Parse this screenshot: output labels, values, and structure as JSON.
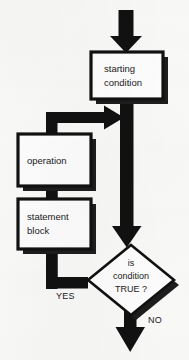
{
  "diagram": {
    "type": "flowchart",
    "background_color": "#fbfbfa",
    "ink_color": "#111111",
    "nodes": [
      {
        "id": "starting-condition",
        "shape": "rectangle",
        "lines": [
          "starting",
          "condition"
        ],
        "box": {
          "x": 91,
          "y": 52,
          "width": 72,
          "height": 47
        },
        "shadow_offset": 5
      },
      {
        "id": "operation",
        "shape": "rectangle",
        "lines": [
          "operation"
        ],
        "box": {
          "x": 18,
          "y": 134,
          "width": 73,
          "height": 52
        },
        "shadow_offset": 5
      },
      {
        "id": "statement-block",
        "shape": "rectangle",
        "lines": [
          "statement",
          "block"
        ],
        "box": {
          "x": 18,
          "y": 199,
          "width": 73,
          "height": 50
        },
        "shadow_offset": 5
      },
      {
        "id": "is-condition-true",
        "shape": "diamond",
        "lines": [
          "is",
          "condition",
          "TRUE ?"
        ],
        "center": {
          "x": 131,
          "y": 280
        },
        "half_width": 43,
        "half_height": 35,
        "shadow_offset": 5
      }
    ],
    "branch_labels": [
      {
        "id": "yes-label",
        "text": "YES",
        "x": 56,
        "y": 296
      },
      {
        "id": "no-label",
        "text": "NO",
        "x": 148,
        "y": 320
      }
    ],
    "arrows": [
      {
        "id": "entry-arrow",
        "direction": "down",
        "from": "top-edge",
        "to": "starting-condition"
      },
      {
        "id": "loop-back-arrow",
        "direction": "right",
        "from": "yes-branch",
        "to": "trunk"
      },
      {
        "id": "trunk-arrow",
        "direction": "down",
        "from": "starting-condition",
        "to": "is-condition-true"
      },
      {
        "id": "yes-branch-arrow",
        "direction": "left-up",
        "from": "is-condition-true",
        "to": "loop-back-arrow"
      },
      {
        "id": "exit-arrow",
        "direction": "down",
        "from": "is-condition-true",
        "to": "bottom-edge"
      }
    ]
  }
}
